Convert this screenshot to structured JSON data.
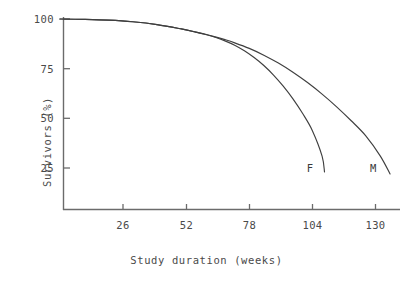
{
  "chart_data": {
    "type": "line",
    "title": "",
    "subtitle": "",
    "xlabel": "Study duration (weeks)",
    "ylabel": "Survivors (%)",
    "xlim": [
      0,
      140
    ],
    "ylim": [
      0,
      100
    ],
    "xticks": [
      26,
      52,
      78,
      104,
      130
    ],
    "xtick_labels": [
      "26",
      "52",
      "78",
      "104",
      "130"
    ],
    "yticks": [
      25,
      50,
      75,
      100
    ],
    "ytick_labels": [
      "25",
      "50",
      "75",
      "100"
    ],
    "grid": false,
    "legend": "inline-end-labels",
    "line_color": "#3f3f3f",
    "axis_color": "#6b6b6b",
    "text_color": "#4a4a4a",
    "background": "#ffffff",
    "series": [
      {
        "name": "F",
        "label": "F",
        "label_position": {
          "x": 103,
          "y": 25
        },
        "x": [
          0,
          10,
          20,
          30,
          40,
          50,
          56,
          60,
          64,
          68,
          72,
          76,
          80,
          84,
          88,
          92,
          96,
          100,
          104,
          108,
          109
        ],
        "values": [
          100,
          99.8,
          99.4,
          98.6,
          97.2,
          95.0,
          93.4,
          92.2,
          90.8,
          89.0,
          86.8,
          84.0,
          80.6,
          76.6,
          71.8,
          66.2,
          59.8,
          52.4,
          43.8,
          31.0,
          23.0
        ]
      },
      {
        "name": "M",
        "label": "M",
        "label_position": {
          "x": 129,
          "y": 25
        },
        "x": [
          0,
          10,
          20,
          30,
          40,
          50,
          56,
          60,
          64,
          68,
          72,
          78,
          84,
          90,
          96,
          102,
          108,
          114,
          120,
          126,
          132,
          136
        ],
        "values": [
          100,
          99.8,
          99.4,
          98.6,
          97.2,
          95.0,
          93.4,
          92.3,
          91.0,
          89.6,
          88.0,
          85.2,
          81.8,
          77.8,
          73.2,
          68.0,
          62.2,
          55.8,
          48.8,
          41.2,
          31.0,
          22.0
        ]
      }
    ]
  },
  "axis": {
    "x_title": "Study duration (weeks)",
    "y_title": "Survivors (%)"
  }
}
